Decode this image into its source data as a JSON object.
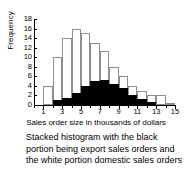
{
  "chart_data": {
    "type": "bar",
    "title": "",
    "subtitle": "",
    "xlabel": "Sales order size in thousands of dollars",
    "ylabel": "Frequency",
    "xlim": [
      0,
      15
    ],
    "ylim": [
      0,
      18
    ],
    "grid": false,
    "legend_position": "none",
    "stacked": true,
    "x_ticks": [
      1,
      3,
      5,
      7,
      9,
      11,
      13,
      15
    ],
    "y_ticks": [
      0,
      2,
      4,
      6,
      8,
      10,
      12,
      14,
      16,
      18
    ],
    "bin_edges": [
      1,
      2,
      3,
      4,
      5,
      6,
      7,
      8,
      9,
      10,
      11,
      12,
      13,
      14
    ],
    "categories": [
      "1-2",
      "2-3",
      "3-4",
      "4-5",
      "5-6",
      "6-7",
      "7-8",
      "8-9",
      "9-10",
      "10-11",
      "11-12",
      "12-13",
      "13-14"
    ],
    "series": [
      {
        "name": "export sales orders",
        "color": "#000000",
        "values": [
          0,
          1,
          1.5,
          2.5,
          4,
          5,
          5.2,
          4.3,
          3.5,
          2.2,
          1.3,
          0.7,
          0
        ]
      },
      {
        "name": "domestic sales orders",
        "color": "#ffffff",
        "values": [
          4,
          9,
          12.5,
          13.5,
          11,
          8,
          6.1,
          3.7,
          2.5,
          1.8,
          1.7,
          1.3,
          2
        ]
      }
    ],
    "totals": [
      4,
      10,
      14,
      16,
      15,
      13,
      11.3,
      8,
      6,
      4,
      3,
      2,
      2
    ],
    "annotations": []
  },
  "caption": {
    "text": "Stacked histogram with the black portion being export sales orders and the white portion domestic sales orders"
  },
  "colors": {
    "export": "#000000",
    "domestic": "#ffffff",
    "bar_outline": "#8d8d8d",
    "axis": "#000000",
    "background": "#ffffff"
  }
}
